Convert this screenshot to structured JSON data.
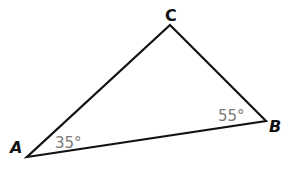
{
  "diagram": {
    "type": "triangle",
    "stroke_color": "#111111",
    "angle_label_color": "#7a7a7a",
    "vertices": [
      {
        "name": "A",
        "label": "A",
        "x": 27,
        "y": 157
      },
      {
        "name": "B",
        "label": "B",
        "x": 266,
        "y": 121
      },
      {
        "name": "C",
        "label": "C",
        "x": 170,
        "y": 25
      }
    ],
    "angles": [
      {
        "vertex": "A",
        "label": "35°"
      },
      {
        "vertex": "B",
        "label": "55°"
      }
    ]
  }
}
